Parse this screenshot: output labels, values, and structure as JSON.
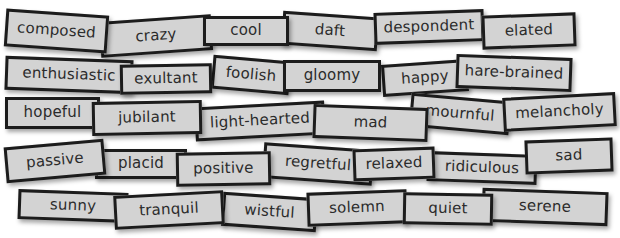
{
  "board": {
    "card_color": "#d3d3d3",
    "border_color": "#1c1c1c",
    "text_color": "#2b2b2b",
    "background": "#ffffff"
  },
  "cards": [
    {
      "word": "composed",
      "x": 5,
      "y": 12,
      "w": 103,
      "h": 38,
      "rot": 4,
      "z": 2
    },
    {
      "word": "crazy",
      "x": 100,
      "y": 18,
      "w": 112,
      "h": 36,
      "rot": -4,
      "z": 1
    },
    {
      "word": "cool",
      "x": 203,
      "y": 16,
      "w": 86,
      "h": 30,
      "rot": 0,
      "z": 3
    },
    {
      "word": "daft",
      "x": 282,
      "y": 14,
      "w": 96,
      "h": 34,
      "rot": 4,
      "z": 1
    },
    {
      "word": "despondent",
      "x": 374,
      "y": 11,
      "w": 110,
      "h": 32,
      "rot": -2,
      "z": 2
    },
    {
      "word": "elated",
      "x": 482,
      "y": 14,
      "w": 94,
      "h": 34,
      "rot": -2,
      "z": 3
    },
    {
      "word": "enthusiastic",
      "x": 5,
      "y": 58,
      "w": 128,
      "h": 34,
      "rot": 2,
      "z": 1
    },
    {
      "word": "exultant",
      "x": 120,
      "y": 64,
      "w": 92,
      "h": 30,
      "rot": -1,
      "z": 2
    },
    {
      "word": "foolish",
      "x": 212,
      "y": 58,
      "w": 78,
      "h": 34,
      "rot": 5,
      "z": 1
    },
    {
      "word": "gloomy",
      "x": 283,
      "y": 60,
      "w": 98,
      "h": 32,
      "rot": 0,
      "z": 2
    },
    {
      "word": "happy",
      "x": 382,
      "y": 62,
      "w": 86,
      "h": 32,
      "rot": -4,
      "z": 1
    },
    {
      "word": "hare-brained",
      "x": 456,
      "y": 56,
      "w": 116,
      "h": 34,
      "rot": 2,
      "z": 2
    },
    {
      "word": "hopeful",
      "x": 5,
      "y": 97,
      "w": 95,
      "h": 32,
      "rot": 0,
      "z": 1
    },
    {
      "word": "jubilant",
      "x": 92,
      "y": 101,
      "w": 110,
      "h": 34,
      "rot": -1,
      "z": 2
    },
    {
      "word": "light-hearted",
      "x": 195,
      "y": 104,
      "w": 130,
      "h": 34,
      "rot": -3,
      "z": 1
    },
    {
      "word": "mad",
      "x": 313,
      "y": 106,
      "w": 115,
      "h": 34,
      "rot": 2,
      "z": 2
    },
    {
      "word": "mournful",
      "x": 410,
      "y": 97,
      "w": 100,
      "h": 34,
      "rot": 5,
      "z": 1
    },
    {
      "word": "melancholy",
      "x": 503,
      "y": 95,
      "w": 113,
      "h": 34,
      "rot": -3,
      "z": 2
    },
    {
      "word": "passive",
      "x": 5,
      "y": 143,
      "w": 100,
      "h": 36,
      "rot": -5,
      "z": 2
    },
    {
      "word": "placid",
      "x": 95,
      "y": 149,
      "w": 92,
      "h": 30,
      "rot": 0,
      "z": 1
    },
    {
      "word": "positive",
      "x": 176,
      "y": 152,
      "w": 95,
      "h": 34,
      "rot": -1,
      "z": 2
    },
    {
      "word": "regretful",
      "x": 263,
      "y": 146,
      "w": 110,
      "h": 36,
      "rot": 4,
      "z": 1
    },
    {
      "word": "relaxed",
      "x": 353,
      "y": 148,
      "w": 82,
      "h": 32,
      "rot": -2,
      "z": 2
    },
    {
      "word": "ridiculous",
      "x": 427,
      "y": 153,
      "w": 110,
      "h": 30,
      "rot": 2,
      "z": 1
    },
    {
      "word": "sad",
      "x": 525,
      "y": 139,
      "w": 88,
      "h": 34,
      "rot": -2,
      "z": 2
    },
    {
      "word": "sunny",
      "x": 18,
      "y": 191,
      "w": 110,
      "h": 30,
      "rot": 2,
      "z": 1
    },
    {
      "word": "tranquil",
      "x": 114,
      "y": 193,
      "w": 110,
      "h": 34,
      "rot": -3,
      "z": 2
    },
    {
      "word": "wistful",
      "x": 222,
      "y": 195,
      "w": 95,
      "h": 34,
      "rot": 4,
      "z": 1
    },
    {
      "word": "solemn",
      "x": 307,
      "y": 191,
      "w": 100,
      "h": 34,
      "rot": -2,
      "z": 2
    },
    {
      "word": "quiet",
      "x": 403,
      "y": 193,
      "w": 90,
      "h": 32,
      "rot": 1,
      "z": 3
    },
    {
      "word": "serene",
      "x": 482,
      "y": 190,
      "w": 126,
      "h": 34,
      "rot": 2,
      "z": 2
    }
  ]
}
